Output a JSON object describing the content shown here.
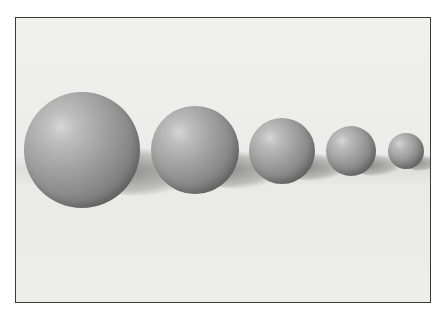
{
  "scene": {
    "description": "Five gray spheres decreasing in size from left to right, casting shadows on a light surface",
    "background_color": "#ececeb",
    "frame_border_color": "#3a3a3a",
    "spheres": [
      {
        "id": 1,
        "cx": 81,
        "cy": 149,
        "r": 58
      },
      {
        "id": 2,
        "cx": 194,
        "cy": 149,
        "r": 44
      },
      {
        "id": 3,
        "cx": 281,
        "cy": 150,
        "r": 33
      },
      {
        "id": 4,
        "cx": 350,
        "cy": 150,
        "r": 25
      },
      {
        "id": 5,
        "cx": 405,
        "cy": 150,
        "r": 18
      }
    ]
  }
}
